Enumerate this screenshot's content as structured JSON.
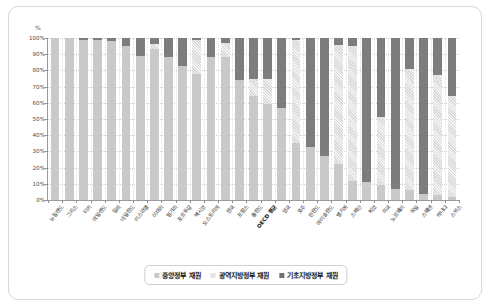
{
  "chart_data": {
    "type": "bar",
    "subtype": "stacked-100-percent-column",
    "title": "",
    "xlabel": "",
    "ylabel": "%",
    "ylim": [
      0,
      100
    ],
    "ytick_labels": [
      "0%",
      "10%",
      "20%",
      "30%",
      "40%",
      "50%",
      "60%",
      "70%",
      "80%",
      "90%",
      "100%"
    ],
    "ytick_values": [
      0,
      10,
      20,
      30,
      40,
      50,
      60,
      70,
      80,
      90,
      100
    ],
    "grid": true,
    "legend_position": "bottom",
    "categories": [
      "뉴질랜드",
      "그리스",
      "터키",
      "아일랜드",
      "칠레",
      "네덜란드",
      "이스라엘",
      "이태리",
      "헝가리",
      "포르투갈",
      "멕시코",
      "오스트리아",
      "한국",
      "프랑스",
      "폴란드",
      "OECD 평균",
      "영국",
      "호주",
      "핀란드",
      "아이슬란드",
      "벨기에",
      "스페인",
      "체코",
      "미국",
      "노르웨이",
      "독일",
      "스웨덴",
      "캐나다",
      "스위스"
    ],
    "series": [
      {
        "name": "중앙정부 재원",
        "pattern": "solid-light-gray",
        "color": "#c9c9c9",
        "values": [
          100,
          100,
          99,
          99,
          98,
          95,
          89,
          93,
          88,
          83,
          78,
          88,
          88,
          74,
          64,
          59,
          57,
          35,
          33,
          27,
          22,
          12,
          11,
          9,
          7,
          6,
          4,
          3,
          2
        ]
      },
      {
        "name": "광역지방정부 재원",
        "pattern": "hatched",
        "color": "#e8e8e8",
        "values": [
          0,
          0,
          0,
          0,
          0,
          0,
          0,
          3,
          0,
          0,
          21,
          0,
          9,
          0,
          11,
          16,
          0,
          64,
          0,
          0,
          74,
          83,
          0,
          42,
          0,
          75,
          0,
          74,
          62
        ]
      },
      {
        "name": "기초지방정부 재원",
        "pattern": "solid-dark-gray",
        "color": "#7d7d7d",
        "values": [
          0,
          0,
          1,
          1,
          2,
          5,
          11,
          4,
          12,
          17,
          1,
          12,
          3,
          26,
          25,
          25,
          43,
          1,
          67,
          73,
          4,
          5,
          89,
          49,
          93,
          19,
          96,
          23,
          36
        ]
      }
    ],
    "emphasized_category": "OECD 평균"
  },
  "legend": {
    "items": [
      {
        "label": "중앙정부 재원",
        "swatch": "central-swatch"
      },
      {
        "label": "광역지방정부 재원",
        "swatch": "regional-swatch"
      },
      {
        "label": "기초지방정부 재원",
        "swatch": "local-swatch"
      }
    ]
  },
  "axis": {
    "y_unit": "%"
  }
}
